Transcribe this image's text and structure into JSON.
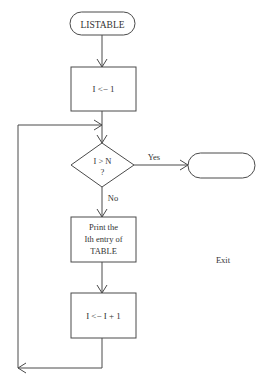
{
  "diagram": {
    "type": "flowchart",
    "colors": {
      "stroke": "#4a4a4a",
      "text": "#333333",
      "background": "#ffffff"
    },
    "nodes": {
      "start": {
        "shape": "terminator",
        "label": "LISTABLE"
      },
      "init": {
        "shape": "process",
        "label": "I <− 1"
      },
      "decision": {
        "shape": "decision",
        "line1": "I > N",
        "line2": "?"
      },
      "print": {
        "shape": "process",
        "line1": "Print the",
        "line2": "Ith entry of",
        "line3": "TABLE"
      },
      "increment": {
        "shape": "process",
        "label": "I <− I + 1"
      },
      "exit": {
        "shape": "terminator",
        "label": ""
      }
    },
    "edges": {
      "yes_label": "Yes",
      "no_label": "No"
    },
    "exit_label": "Exit"
  }
}
